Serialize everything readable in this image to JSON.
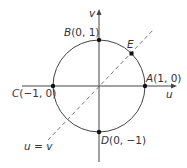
{
  "diagram": {
    "type": "unit-circle-uv-plane",
    "axes": {
      "horizontal_label": "u",
      "vertical_label": "v"
    },
    "points": [
      {
        "id": "A",
        "name": "A",
        "coords": "(1, 0)"
      },
      {
        "id": "B",
        "name": "B",
        "coords": "(0, 1)"
      },
      {
        "id": "C",
        "name": "C",
        "coords": "(−1, 0)"
      },
      {
        "id": "D",
        "name": "D",
        "coords": "(0, −1)"
      },
      {
        "id": "E",
        "name": "E",
        "coords": ""
      }
    ],
    "line_label": "u = v",
    "colors": {
      "stroke": "#444444",
      "dashed": "#777777",
      "point": "#111111"
    }
  }
}
